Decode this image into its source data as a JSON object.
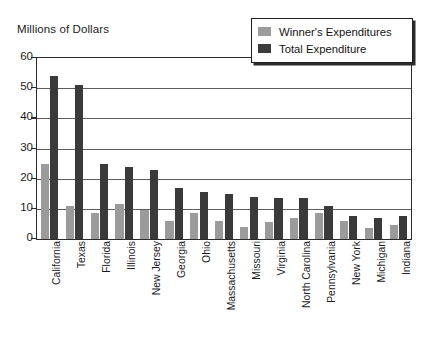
{
  "chart_data": {
    "type": "bar",
    "title": "",
    "xlabel": "",
    "ylabel": "Millions of Dollars",
    "ylim": [
      0,
      60
    ],
    "yticks": [
      0,
      10,
      20,
      30,
      40,
      50,
      60
    ],
    "grid": true,
    "legend_position": "top-right",
    "categories": [
      "California",
      "Texas",
      "Florida",
      "Illinois",
      "New Jersey",
      "Georgia",
      "Ohio",
      "Massachusetts",
      "Missouri",
      "Virginia",
      "North Carolina",
      "Pennsylvania",
      "New York",
      "Michigan",
      "Indiana"
    ],
    "series": [
      {
        "name": "Winner's Expenditures",
        "color": "#9b9b9b",
        "values": [
          25,
          11,
          8.5,
          11.5,
          9.5,
          6,
          8.5,
          6,
          4,
          5.5,
          7,
          8.5,
          6,
          3.5,
          4.5
        ]
      },
      {
        "name": "Total Expenditure",
        "color": "#3a3a3a",
        "values": [
          54,
          51,
          25,
          24,
          23,
          17,
          15.5,
          15,
          14,
          13.5,
          13.5,
          11,
          7.5,
          7,
          7.5
        ]
      }
    ]
  },
  "axis": {
    "y_title": "Millions of Dollars",
    "tick_labels": [
      "60",
      "50",
      "40",
      "30",
      "20",
      "10",
      "0"
    ]
  },
  "legend": {
    "items": [
      {
        "label": "Winner's Expenditures",
        "swatch": "winner"
      },
      {
        "label": "Total Expenditure",
        "swatch": "total"
      }
    ]
  }
}
